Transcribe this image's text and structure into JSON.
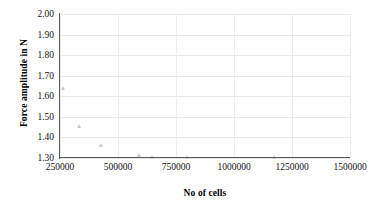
{
  "chart_data": {
    "type": "scatter",
    "title": "",
    "xlabel": "No of cells",
    "ylabel": "Force amplitude in N",
    "xlim": [
      250000,
      1500000
    ],
    "ylim": [
      1.3,
      2.0
    ],
    "grid": true,
    "legend": "none",
    "marker": "triangle",
    "marker_color": "#c9c9c9",
    "xticks": [
      250000,
      500000,
      750000,
      1000000,
      1250000,
      1500000
    ],
    "xtick_labels": [
      "250000",
      "500000",
      "750000",
      "1000000",
      "1250000",
      "1500000"
    ],
    "yticks": [
      1.3,
      1.4,
      1.5,
      1.6,
      1.7,
      1.8,
      1.9,
      2.0
    ],
    "ytick_labels": [
      "1.30",
      "1.40",
      "1.50",
      "1.60",
      "1.70",
      "1.80",
      "1.90",
      "2.00"
    ],
    "series": [
      {
        "name": "Force amplitude",
        "points": [
          {
            "x": 265000,
            "y": 1.64
          },
          {
            "x": 335000,
            "y": 1.455
          },
          {
            "x": 430000,
            "y": 1.36
          },
          {
            "x": 595000,
            "y": 1.315
          },
          {
            "x": 650000,
            "y": 1.302
          },
          {
            "x": 800000,
            "y": 1.301
          },
          {
            "x": 1175000,
            "y": 1.301
          }
        ]
      }
    ]
  },
  "axes": {
    "x_title": "No of cells",
    "y_title": "Force amplitude in N"
  }
}
